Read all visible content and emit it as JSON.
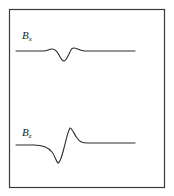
{
  "diagram": {
    "type": "waveform-pair",
    "colors": {
      "frame": "#3a3a3a",
      "trace": "#2a2a2a",
      "background": "#ffffff"
    },
    "panels": [
      {
        "id": "bx",
        "label_main": "B",
        "label_sub": "x",
        "shape": "small negative dip flanked by slight positive bumps"
      },
      {
        "id": "bz",
        "label_main": "B",
        "label_sub": "z",
        "shape": "bipolar: negative lobe followed by positive peak"
      }
    ]
  }
}
